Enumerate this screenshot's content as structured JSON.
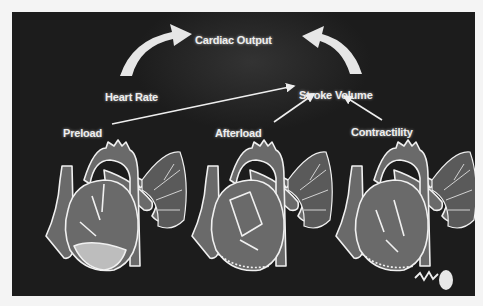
{
  "diagram": {
    "title": "Cardiac Output",
    "nodes": {
      "cardiac_output": "Cardiac Output",
      "heart_rate": "Heart Rate",
      "stroke_volume": "Stroke Volume",
      "preload": "Preload",
      "afterload": "Afterload",
      "contractility": "Contractility"
    },
    "edges": [
      {
        "from": "Heart Rate",
        "to": "Cardiac Output"
      },
      {
        "from": "Stroke Volume",
        "to": "Cardiac Output"
      },
      {
        "from": "Preload",
        "to": "Stroke Volume"
      },
      {
        "from": "Afterload",
        "to": "Stroke Volume"
      },
      {
        "from": "Contractility",
        "to": "Stroke Volume"
      }
    ],
    "illustrations": [
      {
        "name": "heart-preload",
        "caption_ref": "Preload"
      },
      {
        "name": "heart-afterload",
        "caption_ref": "Afterload"
      },
      {
        "name": "heart-contractility",
        "caption_ref": "Contractility"
      }
    ],
    "colors": {
      "background": "#1c1c1c",
      "page": "#f4f4f4",
      "text": "#eeeeee",
      "heart_fill": "#6a6a6a",
      "outline": "#f0f0f0",
      "highlight_fill": "#bdbdbd"
    }
  }
}
